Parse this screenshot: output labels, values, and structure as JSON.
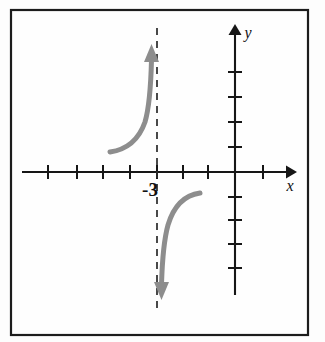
{
  "figure": {
    "name": "rational-function-graph",
    "background_color": "#fdfdfd",
    "frame": {
      "name": "figure-border",
      "x": 11,
      "y": 10,
      "width": 297,
      "height": 325,
      "stroke_color": "#1c1c1c"
    }
  },
  "chart_data": {
    "type": "line",
    "title": "",
    "subtitle": "",
    "xlabel": "x",
    "ylabel": "y",
    "grid": false,
    "legend": null,
    "axes": {
      "x_axis": {
        "label": "x",
        "pixel_y": 172,
        "pixel_x_start": 22,
        "pixel_x_end": 297,
        "arrow": "right",
        "tick_pixel_positions": [
          48,
          77,
          103,
          130,
          157,
          183,
          208,
          263
        ],
        "tick_count": 9,
        "origin_pixel_x": 235,
        "unit_pixels": 26,
        "tick_labels_shown": [
          "-3"
        ]
      },
      "y_axis": {
        "label": "y",
        "pixel_x": 235,
        "pixel_y_top": 28,
        "pixel_y_bottom": 295,
        "arrow": "up",
        "tick_pixel_positions_above": [
          72,
          97,
          122,
          147
        ],
        "tick_pixel_positions_below": [
          197,
          220,
          244,
          268
        ],
        "tick_count": 8,
        "unit_pixels": 24,
        "tick_labels_shown": []
      }
    },
    "asymptotes": [
      {
        "name": "vertical-asymptote",
        "type": "vertical",
        "value": -3,
        "label": "-3",
        "style": "dashed",
        "pixel_x": 157,
        "pixel_y_top": 28,
        "pixel_y_bottom": 312,
        "color": "#2a2a2a"
      }
    ],
    "curves": [
      {
        "name": "left-branch",
        "color": "#8d8d8d",
        "stroke_width": 5,
        "arrow_end": "up",
        "start_point": [
          110,
          152
        ],
        "end_point": [
          152,
          56
        ],
        "shape": "increasing-concave-up-toward-asymptote"
      },
      {
        "name": "right-branch",
        "color": "#8d8d8d",
        "stroke_width": 5,
        "arrow_end": "down",
        "start_point": [
          200,
          193
        ],
        "end_point": [
          162,
          288
        ],
        "shape": "decreasing-concave-down-toward-asymptote"
      }
    ],
    "annotations": [
      {
        "name": "asymptote-value-label",
        "text": "-3",
        "pixel_x": 150,
        "pixel_y": 196,
        "placement": "below-x-axis-left-of-asymptote"
      },
      {
        "name": "x-axis-label",
        "text": "x",
        "pixel_x": 290,
        "pixel_y": 191,
        "placement": "below-x-axis-arrow"
      },
      {
        "name": "y-axis-label",
        "text": "y",
        "pixel_x": 248,
        "pixel_y": 38,
        "placement": "right-of-y-axis-arrow"
      }
    ],
    "colors": {
      "curve": "#8d8d8d",
      "axis": "#161616",
      "asymptote": "#2a2a2a",
      "frame": "#1c1c1c",
      "background": "#fdfdfd"
    }
  }
}
